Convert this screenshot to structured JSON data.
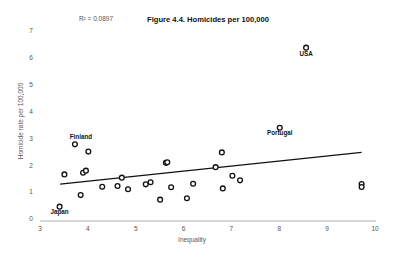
{
  "chart_data": {
    "type": "scatter",
    "title": "Figure 4.4. Homicides per 100,000",
    "xlabel": "Inequality",
    "ylabel": "Homicide rate per 100,000",
    "xlim": [
      3,
      10
    ],
    "ylim": [
      0,
      7
    ],
    "xticks": [
      "3",
      "4",
      "5",
      "6",
      "7",
      "8",
      "9",
      "10"
    ],
    "yticks": [
      "0",
      "1",
      "2",
      "3",
      "4",
      "5",
      "6",
      "7"
    ],
    "grid": false,
    "annotation": "R² = 0.0897",
    "colors": {
      "marker": "#111111",
      "trend": "#111111",
      "axis": "#999999"
    },
    "points": [
      {
        "x": 3.41,
        "y": 0.46,
        "label": "Japan"
      },
      {
        "x": 3.73,
        "y": 2.78,
        "label": "Finland"
      },
      {
        "x": 4.01,
        "y": 2.51
      },
      {
        "x": 3.51,
        "y": 1.66
      },
      {
        "x": 3.9,
        "y": 1.72
      },
      {
        "x": 3.96,
        "y": 1.8
      },
      {
        "x": 4.71,
        "y": 1.54
      },
      {
        "x": 4.3,
        "y": 1.2
      },
      {
        "x": 4.62,
        "y": 1.23
      },
      {
        "x": 4.84,
        "y": 1.11
      },
      {
        "x": 3.85,
        "y": 0.89
      },
      {
        "x": 5.63,
        "y": 2.09
      },
      {
        "x": 5.66,
        "y": 2.11
      },
      {
        "x": 5.21,
        "y": 1.29
      },
      {
        "x": 5.31,
        "y": 1.37
      },
      {
        "x": 5.74,
        "y": 1.18
      },
      {
        "x": 5.51,
        "y": 0.72
      },
      {
        "x": 6.2,
        "y": 1.31
      },
      {
        "x": 6.07,
        "y": 0.77
      },
      {
        "x": 6.8,
        "y": 2.48
      },
      {
        "x": 6.67,
        "y": 1.93
      },
      {
        "x": 7.02,
        "y": 1.61
      },
      {
        "x": 7.18,
        "y": 1.44
      },
      {
        "x": 6.82,
        "y": 1.14
      },
      {
        "x": 8.01,
        "y": 3.4,
        "label": "Portugal"
      },
      {
        "x": 8.56,
        "y": 6.38,
        "label": "USA"
      },
      {
        "x": 9.72,
        "y": 1.3
      },
      {
        "x": 9.72,
        "y": 1.19
      }
    ],
    "trendline": {
      "x": [
        3.42,
        9.72
      ],
      "y": [
        1.3,
        2.48
      ]
    }
  }
}
